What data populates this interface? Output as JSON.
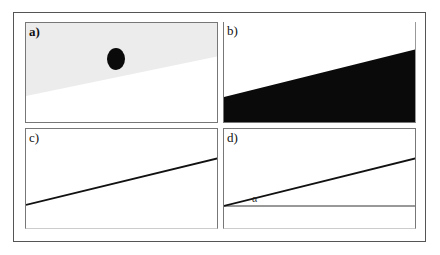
{
  "figure": {
    "panels": [
      {
        "id": "a",
        "label": "a)",
        "content": "gray sloped region with black dot"
      },
      {
        "id": "b",
        "label": "b)",
        "content": "black filled region under sloped line"
      },
      {
        "id": "c",
        "label": "c)",
        "content": "sloped line"
      },
      {
        "id": "d",
        "label": "d)",
        "content": "sloped line with horizontal reference and angle",
        "angle_label": "α"
      }
    ]
  },
  "colors": {
    "frame": "#555555",
    "panel_border": "#777777",
    "gray_fill": "#ececec",
    "black_fill": "#0a0a0a",
    "line": "#111111"
  }
}
